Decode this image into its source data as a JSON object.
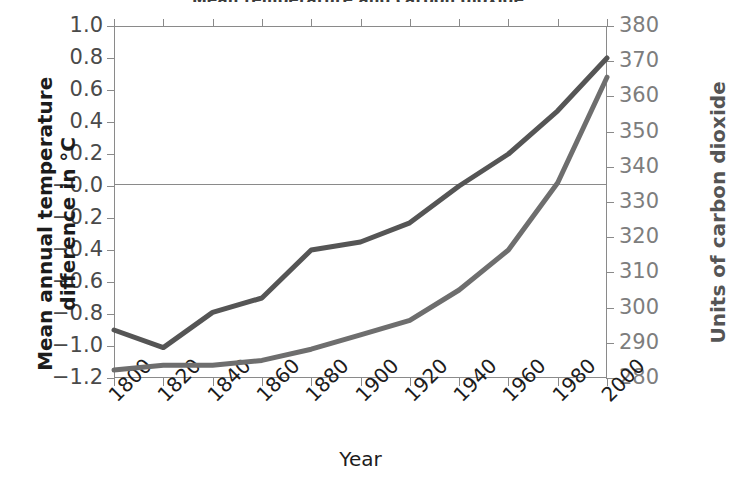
{
  "figure": {
    "title_remnant": "Mean temperature and carbon dioxide",
    "background": "#ffffff"
  },
  "axes": {
    "left": {
      "title": "Mean annual temperature",
      "title_line2": "difference in °C",
      "ticks": [
        "1.0",
        "0.8",
        "0.6",
        "0.4",
        "0.2",
        "−0.0",
        "−0.2",
        "−0.4",
        "−0.6",
        "−0.8",
        "−1.0",
        "−1.2"
      ],
      "color": "#4a4a4a"
    },
    "right": {
      "title": "Units of carbon dioxide",
      "ticks": [
        "380",
        "370",
        "360",
        "350",
        "340",
        "330",
        "320",
        "310",
        "300",
        "290",
        "280"
      ],
      "color": "#7d7d7d"
    },
    "bottom": {
      "title": "Year",
      "ticks": [
        "1800",
        "1820",
        "1840",
        "1860",
        "1880",
        "1900",
        "1920",
        "1940",
        "1960",
        "1980",
        "2000"
      ],
      "color": "#1c1c1c"
    }
  },
  "chart_data": {
    "type": "line",
    "title": "Mean temperature and carbon dioxide",
    "xlabel": "Year",
    "ylabel": "Mean annual temperature difference in °C",
    "y2label": "Units of carbon dioxide",
    "x": [
      1800,
      1820,
      1840,
      1860,
      1880,
      1900,
      1920,
      1940,
      1960,
      1980,
      2000
    ],
    "xlim": [
      1800,
      2000
    ],
    "ylim": [
      -1.2,
      1.0
    ],
    "y2lim": [
      280,
      380
    ],
    "grid": false,
    "legend": "none",
    "series": [
      {
        "name": "Mean annual temperature difference",
        "axis": "left",
        "color": "#555555",
        "units": "°C",
        "values": [
          -0.9,
          -1.01,
          -0.79,
          -0.7,
          -0.4,
          -0.35,
          -0.23,
          0.0,
          0.2,
          0.47,
          0.8
        ]
      },
      {
        "name": "Carbon dioxide",
        "axis": "right",
        "color": "#6e6e6e",
        "units": "units",
        "values_left_scale": [
          -1.15,
          -1.12,
          -1.12,
          -1.09,
          -1.02,
          -0.93,
          -0.84,
          -0.65,
          -0.4,
          0.02,
          0.68
        ],
        "values": [
          282.5,
          283.6,
          283.6,
          285.0,
          288.2,
          292.3,
          296.4,
          305.0,
          316.4,
          335.5,
          365.5
        ]
      }
    ]
  }
}
